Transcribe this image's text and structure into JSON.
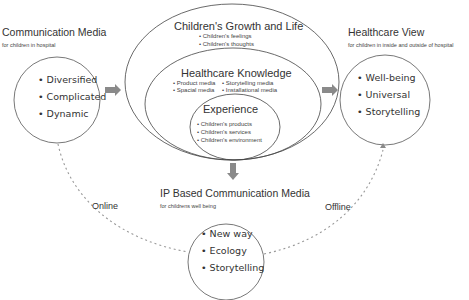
{
  "left_block": {
    "title": "Communication Media",
    "subtitle": "for children in hospital",
    "items": [
      "• Diversified",
      "• Complicated",
      "• Dynamic"
    ]
  },
  "center_block": {
    "outer": {
      "title": "Children's Growth and Life",
      "items": [
        "• Children's feelings",
        "• Children's thoughts"
      ]
    },
    "middle": {
      "title": "Healthcare Knowledge",
      "items_left": [
        "• Product media",
        "• Spacial media"
      ],
      "items_right": [
        "• Storytelling media",
        "• Installational media"
      ]
    },
    "inner": {
      "title": "Experience",
      "items": [
        "• Children's products",
        "• Children's services",
        "• Children's environment"
      ]
    }
  },
  "right_block": {
    "title": "Healthcare View",
    "subtitle": "for children in inside and outside of hospital",
    "items": [
      "• Well-being",
      "• Universal",
      "• Storytelling"
    ]
  },
  "bottom_block": {
    "title": "IP Based Communication Media",
    "subtitle": "for childrens well being",
    "items": [
      "• New way",
      "• Ecology",
      "• Storytelling"
    ]
  },
  "connectors": {
    "online_label": "Online",
    "offline_label": "Offline"
  },
  "colors": {
    "stroke": "#555555",
    "arrow": "#8a8a8a",
    "dashed": "#999999",
    "text": "#333333"
  }
}
